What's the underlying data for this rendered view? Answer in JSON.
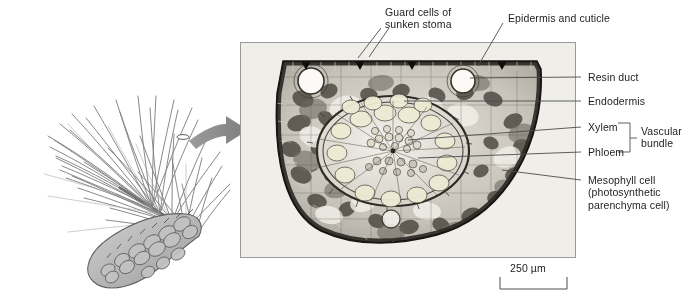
{
  "figure": {
    "scale_bar": {
      "label": "250 µm",
      "length_px": 67
    },
    "arrow": {
      "name": "magnification-arrow",
      "color": "#8c8c8c"
    }
  },
  "specimen": {
    "name": "pine-branch-illustration",
    "parts": [
      "needles",
      "branch",
      "pine-cone"
    ],
    "colors": {
      "ink": "#6e6e6e",
      "fill": "#b9b9b9"
    }
  },
  "micrograph": {
    "name": "needle-cross-section-micrograph",
    "frame_color": "#9a9a9a",
    "background": "#efeee9"
  },
  "labels": {
    "top": [
      {
        "id": "guard-cells",
        "line1": "Guard cells of",
        "line2": "sunken stoma"
      },
      {
        "id": "epidermis-cuticle",
        "line1": "Epidermis and cuticle",
        "line2": ""
      }
    ],
    "right": [
      {
        "id": "resin-duct",
        "text": "Resin duct"
      },
      {
        "id": "endodermis",
        "text": "Endodermis"
      },
      {
        "id": "xylem",
        "text": "Xylem"
      },
      {
        "id": "phloem",
        "text": "Phloem"
      },
      {
        "id": "mesophyll-1",
        "text": "Mesophyll cell"
      },
      {
        "id": "mesophyll-2",
        "text": "(photosynthetic"
      },
      {
        "id": "mesophyll-3",
        "text": "parenchyma cell)"
      }
    ],
    "bracket": {
      "id": "vascular-bundle",
      "line1": "Vascular",
      "line2": "bundle"
    }
  }
}
